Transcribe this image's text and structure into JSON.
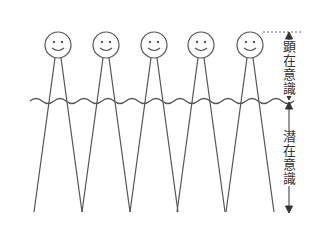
{
  "diagram": {
    "type": "iceberg-consciousness-figures",
    "colors": {
      "stroke": "#555555",
      "text": "#333333",
      "background": "#ffffff"
    },
    "figures": [
      {
        "id": 1,
        "head_cx": 58,
        "head_cy": 45,
        "expression": "smile"
      },
      {
        "id": 2,
        "head_cx": 106,
        "head_cy": 45,
        "expression": "smile"
      },
      {
        "id": 3,
        "head_cx": 154,
        "head_cy": 45,
        "expression": "smile"
      },
      {
        "id": 4,
        "head_cx": 201,
        "head_cy": 45,
        "expression": "smile"
      },
      {
        "id": 5,
        "head_cx": 250,
        "head_cy": 45,
        "expression": "smile"
      }
    ],
    "surface_line": "wavy",
    "labels": {
      "conscious": [
        "顕",
        "在",
        "意",
        "識"
      ],
      "subconscious": [
        "潜",
        "在",
        "意",
        "識"
      ]
    },
    "annotations": {
      "conscious_arrow": "double-headed vertical arrow from head top to water line",
      "subconscious_arrow": "double-headed vertical arrow from water line to bottom"
    }
  }
}
